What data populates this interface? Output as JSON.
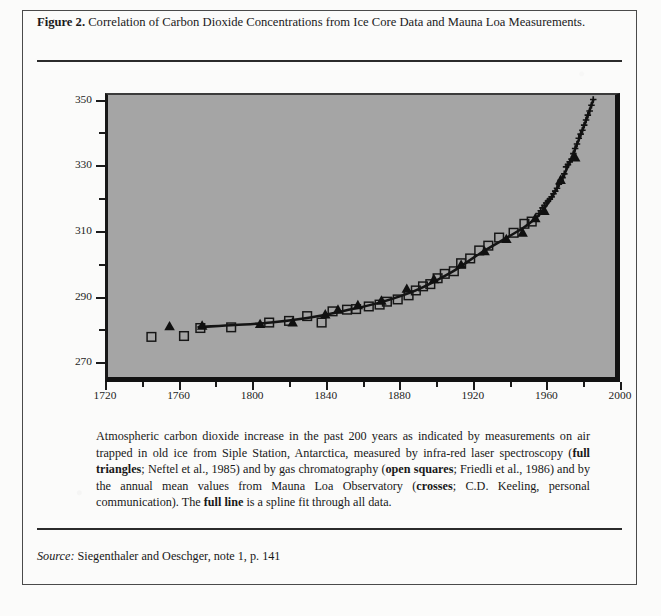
{
  "figure": {
    "label": "Figure 2.",
    "title": "Correlation of Carbon Dioxide Concentrations from Ice Core Data and Mauna Loa Measurements."
  },
  "caption": {
    "part1": "Atmospheric carbon dioxide increase in the past 200 years as indicated by measurements on air trapped in old ice from Siple Station, Antarctica, measured by infra-red laser spectroscopy (",
    "b1": "full triangles",
    "part2": "; Neftel et al., 1985) and by gas chromatography (",
    "b2": "open squares",
    "part3": "; Friedli et al., 1986) and by the annual mean values from Mauna Loa Observatory (",
    "b3": "crosses",
    "part4": "; C.D. Keeling, personal communication). The ",
    "b4": "full line",
    "part5": " is a spline fit through all data."
  },
  "source": {
    "label": "Source:",
    "text": " Siegenthaler and Oeschger,  note 1, p. 141"
  },
  "chart_data": {
    "type": "scatter",
    "title": "",
    "xlabel": "",
    "ylabel": "",
    "xlim": [
      1720,
      2000
    ],
    "ylim": [
      264,
      352
    ],
    "xticks": [
      1720,
      1760,
      1800,
      1840,
      1880,
      1920,
      1960,
      2000
    ],
    "xticks_minor": [
      1740,
      1780,
      1820,
      1860,
      1900,
      1940,
      1980
    ],
    "yticks": [
      270,
      290,
      310,
      330,
      350
    ],
    "yticks_minor": [
      280,
      300,
      320,
      340
    ],
    "grid": false,
    "legend_position": "none",
    "plot_bgcolor": "#a5a5a5",
    "series": [
      {
        "name": "open squares",
        "marker": "square",
        "source": "gas chromatography; Friedli et al., 1986",
        "points": [
          [
            1744,
            276.5
          ],
          [
            1762,
            276.8
          ],
          [
            1771,
            279.3
          ],
          [
            1788,
            279.5
          ],
          [
            1809,
            281.0
          ],
          [
            1820,
            281.5
          ],
          [
            1830,
            283.0
          ],
          [
            1838,
            281.0
          ],
          [
            1844,
            284.5
          ],
          [
            1852,
            285.0
          ],
          [
            1857,
            285.2
          ],
          [
            1864,
            286.0
          ],
          [
            1870,
            286.6
          ],
          [
            1874,
            287.5
          ],
          [
            1880,
            288.2
          ],
          [
            1886,
            289.5
          ],
          [
            1890,
            291.0
          ],
          [
            1894,
            292.3
          ],
          [
            1898,
            293.0
          ],
          [
            1902,
            294.8
          ],
          [
            1906,
            296.2
          ],
          [
            1911,
            297.0
          ],
          [
            1915,
            299.5
          ],
          [
            1920,
            301.0
          ],
          [
            1925,
            303.5
          ],
          [
            1930,
            305.0
          ],
          [
            1936,
            307.5
          ],
          [
            1944,
            309.0
          ],
          [
            1950,
            311.8
          ],
          [
            1954,
            312.5
          ]
        ]
      },
      {
        "name": "full triangles",
        "marker": "triangle",
        "source": "infra-red laser spectroscopy; Neftel et al., 1985",
        "points": [
          [
            1754,
            279.8
          ],
          [
            1772,
            280.0
          ],
          [
            1804,
            280.5
          ],
          [
            1822,
            281.0
          ],
          [
            1840,
            283.5
          ],
          [
            1847,
            285.0
          ],
          [
            1858,
            286.4
          ],
          [
            1871,
            287.8
          ],
          [
            1885,
            291.5
          ],
          [
            1900,
            294.5
          ],
          [
            1915,
            299.0
          ],
          [
            1928,
            303.2
          ],
          [
            1940,
            307.0
          ],
          [
            1949,
            309.0
          ],
          [
            1956,
            313.5
          ],
          [
            1961,
            315.8
          ],
          [
            1970,
            325.5
          ],
          [
            1978,
            332.5
          ]
        ]
      },
      {
        "name": "crosses",
        "marker": "cross",
        "source": "Mauna Loa Observatory annual means; C.D. Keeling",
        "points": [
          [
            1958,
            315.0
          ],
          [
            1959,
            315.9
          ],
          [
            1960,
            316.8
          ],
          [
            1961,
            317.5
          ],
          [
            1962,
            318.3
          ],
          [
            1963,
            318.9
          ],
          [
            1964,
            319.5
          ],
          [
            1965,
            320.2
          ],
          [
            1966,
            321.2
          ],
          [
            1967,
            322.0
          ],
          [
            1968,
            322.9
          ],
          [
            1969,
            324.2
          ],
          [
            1970,
            325.4
          ],
          [
            1971,
            326.2
          ],
          [
            1972,
            327.4
          ],
          [
            1973,
            329.6
          ],
          [
            1974,
            330.3
          ],
          [
            1975,
            331.1
          ],
          [
            1976,
            332.0
          ],
          [
            1977,
            333.7
          ],
          [
            1978,
            335.3
          ],
          [
            1979,
            336.7
          ],
          [
            1980,
            338.5
          ],
          [
            1981,
            339.8
          ],
          [
            1982,
            341.0
          ],
          [
            1983,
            342.6
          ],
          [
            1984,
            344.2
          ],
          [
            1985,
            345.7
          ],
          [
            1986,
            347.0
          ],
          [
            1987,
            348.8
          ],
          [
            1988,
            350.6
          ]
        ]
      }
    ],
    "spline_fit": {
      "name": "full line",
      "description": "spline fit through all data",
      "points": [
        [
          1770,
          279.6
        ],
        [
          1790,
          280.2
        ],
        [
          1810,
          281.0
        ],
        [
          1830,
          282.4
        ],
        [
          1850,
          284.6
        ],
        [
          1870,
          287.2
        ],
        [
          1890,
          291.0
        ],
        [
          1910,
          296.8
        ],
        [
          1925,
          302.4
        ],
        [
          1940,
          307.4
        ],
        [
          1950,
          310.8
        ],
        [
          1958,
          314.5
        ],
        [
          1965,
          320.0
        ],
        [
          1972,
          327.2
        ],
        [
          1980,
          338.0
        ],
        [
          1988,
          350.4
        ]
      ]
    }
  }
}
